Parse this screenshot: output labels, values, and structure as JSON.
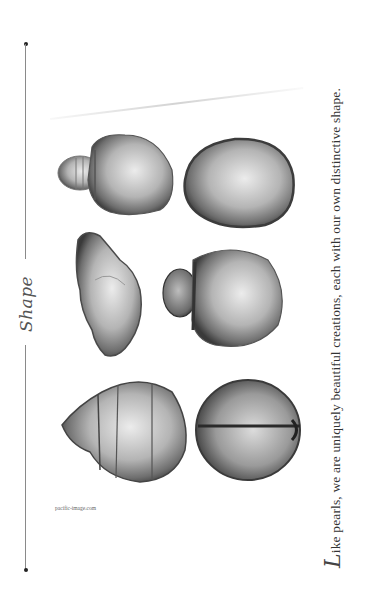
{
  "page": {
    "orientation": "rotated-90-ccw",
    "background": "#ffffff"
  },
  "title": "Shape",
  "headline": {
    "drop_cap": "L",
    "text": "ike pearls, we are uniquely beautiful creations, each with our own distinctive shape."
  },
  "credit": "pacific-image.com",
  "pearls": [
    {
      "name": "stepped-drop-pearl",
      "description": "drop pearl with ringed conical tip"
    },
    {
      "name": "drop-pearl",
      "description": "smooth teardrop pearl"
    },
    {
      "name": "baroque-pearl",
      "description": "irregular baroque pearl"
    },
    {
      "name": "button-pearl",
      "description": "round pearl with small cap"
    },
    {
      "name": "ringed-cone-pearl",
      "description": "circled pearl with conical end"
    },
    {
      "name": "circled-round-pearl",
      "description": "round pearl with single groove"
    }
  ],
  "colors": {
    "text": "#333333",
    "rule": "#8a8a8a",
    "pearl_dark": "#3c3c3c",
    "pearl_mid": "#8d8d8d",
    "pearl_light": "#e6e6e6"
  }
}
